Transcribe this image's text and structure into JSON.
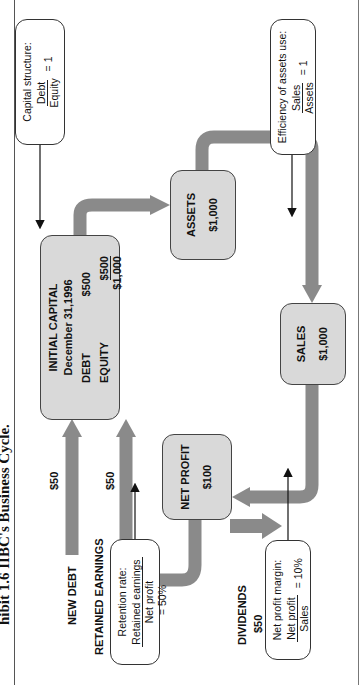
{
  "caption": "hibit 1.6  IIBC's Business Cycle.",
  "colors": {
    "arrow": "#8a8a8a",
    "box_fill": "#d9d9d9",
    "box_border": "#444444",
    "note_fill": "#ffffff"
  },
  "nodes": {
    "initial_capital": {
      "title": "INITIAL CAPITAL",
      "date": "December 31,1996",
      "debt_label": "DEBT",
      "debt_value": "$500",
      "equity_label": "EQUITY",
      "equity_value": "$500",
      "total": "$1,000"
    },
    "assets": {
      "title": "ASSETS",
      "value": "$1,000"
    },
    "sales": {
      "title": "SALES",
      "value": "$1,000"
    },
    "net_profit": {
      "title": "NET PROFIT",
      "value": "$100"
    }
  },
  "notes": {
    "capital_structure": {
      "title": "Capital structure:",
      "numerator": "Debt",
      "denominator": "Equity",
      "result": "= 1"
    },
    "efficiency": {
      "title": "Efficiency of assets use:",
      "numerator": "Sales",
      "denominator": "Assets",
      "result": "= 1"
    },
    "net_profit_margin": {
      "title": "Net profit margin:",
      "numerator": "Net profit",
      "denominator": "Sales",
      "result": "= 10%"
    },
    "retention": {
      "title": "Retention rate:",
      "numerator": "Retained earnings",
      "denominator": "Net profit",
      "result": "= 50%"
    }
  },
  "flows": {
    "new_debt": {
      "label": "NEW DEBT",
      "amount": "$50"
    },
    "retained_earnings": {
      "label": "RETAINED EARNINGS",
      "amount": "$50"
    },
    "dividends": {
      "label": "DIVIDENDS",
      "amount": "$50"
    }
  }
}
